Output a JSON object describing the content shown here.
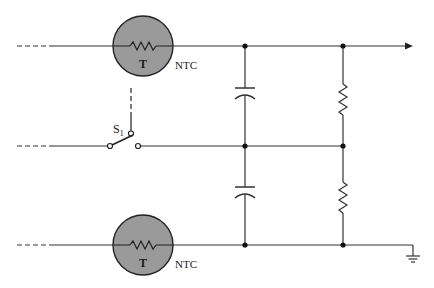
{
  "diagram": {
    "type": "circuit-schematic",
    "thermistors": [
      {
        "id": "top",
        "label": "T",
        "type_label": "NTC"
      },
      {
        "id": "bottom",
        "label": "T",
        "type_label": "NTC"
      }
    ],
    "switch": {
      "label": "S",
      "subscript": "1"
    },
    "components": [
      "thermistor-top",
      "thermistor-bottom",
      "switch-s1",
      "capacitor-top",
      "capacitor-bottom",
      "resistor-top",
      "resistor-bottom",
      "ground",
      "output-arrow"
    ],
    "colors": {
      "line": "#333333",
      "thermistor_fill": "#9a9a9a",
      "background": "#ffffff"
    }
  }
}
